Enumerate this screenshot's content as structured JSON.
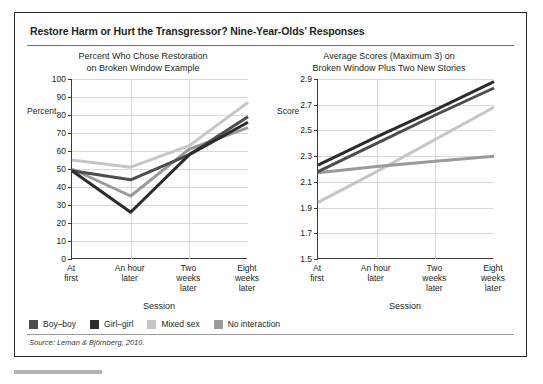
{
  "figure": {
    "title": "Restore Harm or Hurt the Transgressor? Nine-Year-Olds’ Responses",
    "source": "Source: Leman & Björnberg, 2010."
  },
  "legend": {
    "items": [
      {
        "label": "Boy–boy",
        "color": "#4d4d4d"
      },
      {
        "label": "Girl–girl",
        "color": "#2b2b2b"
      },
      {
        "label": "Mixed sex",
        "color": "#c6c6c6"
      },
      {
        "label": "No interaction",
        "color": "#9a9a9a"
      }
    ]
  },
  "chart_data": [
    {
      "type": "line",
      "id": "left",
      "title": "Percent Who Chose Restoration\non Broken Window Example",
      "title_line1": "Percent Who Chose Restoration",
      "title_line2": "on Broken Window Example",
      "xlabel": "Session",
      "ylabel": "Percent",
      "categories": [
        "At\nfirst",
        "An hour\nlater",
        "Two\nweeks\nlater",
        "Eight\nweeks\nlater"
      ],
      "category_labels": [
        [
          "At",
          "first"
        ],
        [
          "An hour",
          "later"
        ],
        [
          "Two",
          "weeks",
          "later"
        ],
        [
          "Eight",
          "weeks",
          "later"
        ]
      ],
      "ylim": [
        0,
        100
      ],
      "yticks": [
        0,
        10,
        20,
        30,
        40,
        50,
        60,
        70,
        80,
        90,
        100
      ],
      "ytick_labels": [
        "0",
        "10",
        "20",
        "30",
        "40",
        "50",
        "60",
        "70",
        "80",
        "90",
        "100"
      ],
      "grid": true,
      "legend_position": "below-figure",
      "series": [
        {
          "name": "Boy–boy",
          "color": "#4d4d4d",
          "values": [
            49,
            44,
            58,
            79
          ]
        },
        {
          "name": "Girl–girl",
          "color": "#2b2b2b",
          "values": [
            49,
            26,
            58,
            76
          ]
        },
        {
          "name": "Mixed sex",
          "color": "#c6c6c6",
          "values": [
            55,
            51,
            63,
            87
          ]
        },
        {
          "name": "No interaction",
          "color": "#9a9a9a",
          "values": [
            50,
            35,
            61,
            73
          ]
        }
      ]
    },
    {
      "type": "line",
      "id": "right",
      "title": "Average Scores (Maximum 3) on\nBroken Window Plus Two New Stories",
      "title_line1": "Average Scores (Maximum 3) on",
      "title_line2": "Broken Window Plus Two New Stories",
      "xlabel": "Session",
      "ylabel": "Score",
      "categories": [
        "At\nfirst",
        "An hour\nlater",
        "Two\nweeks\nlater",
        "Eight\nweeks\nlater"
      ],
      "category_labels": [
        [
          "At",
          "first"
        ],
        [
          "An hour",
          "later"
        ],
        [
          "Two",
          "weeks",
          "later"
        ],
        [
          "Eight",
          "weeks",
          "later"
        ]
      ],
      "ylim": [
        1.5,
        2.9
      ],
      "yticks": [
        1.5,
        1.7,
        1.9,
        2.1,
        2.3,
        2.5,
        2.7,
        2.9
      ],
      "ytick_labels": [
        "1.5",
        "1.7",
        "1.9",
        "2.1",
        "2.3",
        "2.5",
        "2.7",
        "2.9"
      ],
      "grid": true,
      "legend_position": "below-figure",
      "series": [
        {
          "name": "Boy–boy",
          "color": "#4d4d4d",
          "values": [
            2.18,
            2.4,
            2.62,
            2.83
          ]
        },
        {
          "name": "Girl–girl",
          "color": "#2b2b2b",
          "values": [
            2.23,
            2.45,
            2.66,
            2.88
          ]
        },
        {
          "name": "Mixed sex",
          "color": "#c6c6c6",
          "values": [
            1.94,
            2.18,
            2.43,
            2.68
          ]
        },
        {
          "name": "No interaction",
          "color": "#9a9a9a",
          "values": [
            2.17,
            2.22,
            2.26,
            2.3
          ]
        }
      ]
    }
  ]
}
